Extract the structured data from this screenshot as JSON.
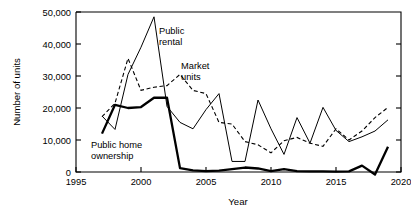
{
  "chart_data": {
    "type": "line",
    "title": "",
    "xlabel": "Year",
    "ylabel": "Number of units",
    "xlim": [
      1995,
      2020
    ],
    "ylim": [
      0,
      50000
    ],
    "grid": false,
    "legend_position": "inline-annotations",
    "xticks": [
      "1995",
      "2000",
      "2005",
      "2010",
      "2015",
      "2020"
    ],
    "xtick_values": [
      1995,
      2000,
      2005,
      2010,
      2015,
      2020
    ],
    "yticks": [
      "0",
      "10,000",
      "20,000",
      "30,000",
      "40,000",
      "50,000"
    ],
    "ytick_values": [
      0,
      10000,
      20000,
      30000,
      40000,
      50000
    ],
    "x": [
      1997,
      1998,
      1999,
      2000,
      2001,
      2002,
      2003,
      2004,
      2005,
      2006,
      2007,
      2008,
      2009,
      2010,
      2011,
      2012,
      2013,
      2014,
      2015,
      2016,
      2017,
      2018,
      2019
    ],
    "series": [
      {
        "name": "Public rental",
        "style": "solid",
        "annotation": "Public\nrental",
        "values": [
          17500,
          13300,
          30500,
          39000,
          48500,
          20500,
          15500,
          13500,
          19500,
          24500,
          3300,
          3300,
          22500,
          13500,
          5500,
          17000,
          9000,
          20200,
          13000,
          9500,
          11000,
          12800,
          16300
        ]
      },
      {
        "name": "Market units",
        "style": "dashed",
        "annotation": "Market\nunits",
        "values": [
          17300,
          21500,
          35500,
          25500,
          26500,
          27000,
          30500,
          25500,
          24500,
          15500,
          15000,
          9500,
          8500,
          6000,
          9800,
          10800,
          9000,
          8000,
          13500,
          10000,
          12800,
          17000,
          20200
        ]
      },
      {
        "name": "Public home ownership",
        "style": "thick-solid",
        "annotation": "Public home\nownership",
        "values": [
          12000,
          21000,
          20000,
          20300,
          23200,
          23200,
          1200,
          500,
          300,
          400,
          900,
          1400,
          1100,
          300,
          900,
          300,
          200,
          200,
          100,
          200,
          2000,
          -800,
          7900
        ]
      }
    ],
    "annotations": [
      {
        "name": "public-rental-label",
        "text_line1": "Public",
        "text_line2": "rental"
      },
      {
        "name": "market-units-label",
        "text_line1": "Market",
        "text_line2": "units"
      },
      {
        "name": "public-home-label",
        "text_line1": "Public home",
        "text_line2": "ownership"
      }
    ]
  }
}
